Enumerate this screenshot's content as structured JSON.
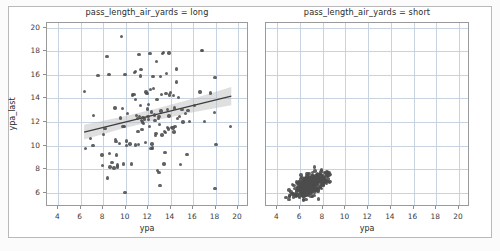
{
  "figure": {
    "facet_variable": "pass_length_air_yards",
    "background_color": "#ffffff",
    "point_color": "#4c4c4c",
    "line_color": "#3d3d3d",
    "band_color": "#b8b8b8",
    "grid_color": "#c7d3e0"
  },
  "chart_data": {
    "type": "scatter",
    "title": "",
    "xlabel": "ypa",
    "ylabel": "ypa_last",
    "xlim": [
      3.0,
      20.8
    ],
    "ylim": [
      4.8,
      20.4
    ],
    "xticks": [
      4,
      6,
      8,
      10,
      12,
      14,
      16,
      18,
      20
    ],
    "yticks": [
      6,
      8,
      10,
      12,
      14,
      16,
      18,
      20
    ],
    "grid": true,
    "legend": "none",
    "facets": [
      {
        "label": "pass_length_air_yards = long",
        "facet_value": "long",
        "xlabel": "ypa",
        "ylabel": "ypa_last",
        "regression": {
          "visible": true,
          "x_start": 6.3,
          "y_start": 11.15,
          "x_end": 19.4,
          "y_end": 14.2,
          "ci_band": true,
          "ci_start_half_width": 0.62,
          "ci_mid_half_width": 0.3,
          "ci_end_half_width": 0.78
        },
        "points": [
          [
            6.35,
            14.6
          ],
          [
            6.4,
            9.75
          ],
          [
            6.85,
            10.6
          ],
          [
            7.1,
            10.0
          ],
          [
            7.15,
            12.55
          ],
          [
            7.55,
            15.95
          ],
          [
            7.95,
            8.3
          ],
          [
            7.9,
            9.2
          ],
          [
            8.05,
            10.95
          ],
          [
            8.15,
            11.45
          ],
          [
            8.35,
            17.55
          ],
          [
            8.4,
            7.25
          ],
          [
            8.5,
            16.05
          ],
          [
            8.55,
            9.35
          ],
          [
            8.6,
            8.2
          ],
          [
            8.8,
            8.55
          ],
          [
            8.95,
            8.1
          ],
          [
            9.05,
            13.2
          ],
          [
            9.1,
            10.5
          ],
          [
            9.15,
            10.35
          ],
          [
            9.2,
            9.2
          ],
          [
            9.25,
            8.35
          ],
          [
            9.3,
            8.2
          ],
          [
            9.45,
            10.2
          ],
          [
            9.55,
            12.35
          ],
          [
            9.65,
            19.25
          ],
          [
            9.7,
            13.15
          ],
          [
            9.75,
            11.6
          ],
          [
            9.8,
            8.45
          ],
          [
            9.9,
            11.65
          ],
          [
            9.95,
            16.05
          ],
          [
            9.95,
            6.05
          ],
          [
            10.05,
            10.0
          ],
          [
            10.1,
            10.4
          ],
          [
            10.15,
            12.75
          ],
          [
            10.4,
            10.15
          ],
          [
            10.5,
            8.45
          ],
          [
            10.6,
            14.3
          ],
          [
            10.75,
            14.35
          ],
          [
            10.8,
            16.2
          ],
          [
            10.85,
            16.3
          ],
          [
            10.9,
            13.9
          ],
          [
            10.95,
            12.55
          ],
          [
            11.05,
            12.3
          ],
          [
            11.1,
            11.2
          ],
          [
            11.15,
            10.1
          ],
          [
            11.2,
            17.75
          ],
          [
            11.25,
            12.45
          ],
          [
            11.3,
            13.4
          ],
          [
            11.35,
            16.45
          ],
          [
            11.4,
            12.15
          ],
          [
            11.45,
            11.35
          ],
          [
            11.5,
            12.0
          ],
          [
            11.55,
            12.4
          ],
          [
            11.6,
            11.9
          ],
          [
            11.7,
            12.25
          ],
          [
            11.75,
            10.25
          ],
          [
            11.8,
            14.55
          ],
          [
            11.9,
            14.4
          ],
          [
            11.95,
            13.1
          ],
          [
            12.0,
            12.45
          ],
          [
            12.05,
            12.2
          ],
          [
            12.1,
            11.6
          ],
          [
            12.15,
            17.8
          ],
          [
            12.2,
            14.75
          ],
          [
            12.3,
            12.85
          ],
          [
            12.35,
            10.15
          ],
          [
            12.4,
            9.8
          ],
          [
            12.45,
            15.85
          ],
          [
            12.5,
            14.85
          ],
          [
            12.55,
            12.6
          ],
          [
            12.6,
            12.15
          ],
          [
            12.65,
            10.85
          ],
          [
            12.7,
            11.05
          ],
          [
            12.75,
            17.15
          ],
          [
            12.8,
            13.9
          ],
          [
            12.85,
            7.9
          ],
          [
            12.9,
            12.3
          ],
          [
            12.95,
            7.75
          ],
          [
            12.95,
            12.45
          ],
          [
            13.0,
            11.8
          ],
          [
            13.05,
            6.6
          ],
          [
            13.1,
            15.85
          ],
          [
            13.15,
            12.95
          ],
          [
            13.2,
            14.35
          ],
          [
            13.25,
            10.9
          ],
          [
            13.3,
            17.8
          ],
          [
            13.35,
            17.9
          ],
          [
            13.4,
            8.45
          ],
          [
            13.45,
            11.2
          ],
          [
            13.5,
            9.4
          ],
          [
            13.55,
            11.1
          ],
          [
            13.6,
            14.4
          ],
          [
            13.65,
            16.1
          ],
          [
            13.7,
            13.05
          ],
          [
            13.75,
            11.55
          ],
          [
            13.8,
            11.4
          ],
          [
            13.85,
            12.5
          ],
          [
            13.9,
            14.3
          ],
          [
            14.0,
            14.5
          ],
          [
            14.1,
            11.55
          ],
          [
            14.2,
            11.5
          ],
          [
            14.25,
            14.25
          ],
          [
            14.3,
            11.15
          ],
          [
            14.35,
            13.2
          ],
          [
            14.4,
            11.6
          ],
          [
            14.5,
            16.5
          ],
          [
            14.55,
            15.4
          ],
          [
            14.6,
            12.3
          ],
          [
            14.7,
            14.1
          ],
          [
            14.8,
            12.45
          ],
          [
            15.0,
            13.05
          ],
          [
            15.1,
            12.0
          ],
          [
            15.3,
            12.75
          ],
          [
            15.45,
            9.25
          ],
          [
            15.55,
            13.0
          ],
          [
            15.7,
            12.05
          ],
          [
            16.1,
            13.4
          ],
          [
            16.6,
            14.55
          ],
          [
            16.75,
            18.05
          ],
          [
            16.85,
            18.05
          ],
          [
            17.0,
            12.05
          ],
          [
            17.55,
            14.45
          ],
          [
            17.9,
            12.8
          ],
          [
            17.95,
            15.8
          ],
          [
            17.95,
            6.35
          ],
          [
            18.05,
            10.1
          ],
          [
            19.35,
            11.65
          ],
          [
            14.9,
            8.4
          ],
          [
            12.25,
            9.75
          ],
          [
            11.3,
            15.9
          ],
          [
            13.85,
            17.85
          ],
          [
            12.05,
            13.5
          ],
          [
            10.9,
            10.05
          ]
        ]
      },
      {
        "label": "pass_length_air_yards = short",
        "facet_value": "short",
        "xlabel": "ypa",
        "ylabel": "ypa_last",
        "regression": {
          "visible": false
        },
        "cluster": {
          "center_x": 6.9,
          "center_y": 6.75,
          "x_range": [
            4.3,
            8.8
          ],
          "y_range": [
            5.2,
            8.3
          ],
          "n_points": 430
        },
        "points": []
      }
    ]
  }
}
